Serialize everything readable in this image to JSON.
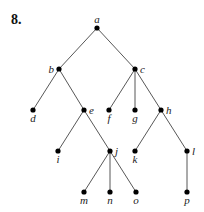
{
  "problem_number": "8.",
  "tree": {
    "nodes": [
      {
        "id": "a",
        "label": "a",
        "x": 97,
        "y": 28,
        "label_pos": "above"
      },
      {
        "id": "b",
        "label": "b",
        "x": 59,
        "y": 69,
        "label_pos": "left"
      },
      {
        "id": "c",
        "label": "c",
        "x": 135,
        "y": 69,
        "label_pos": "right"
      },
      {
        "id": "d",
        "label": "d",
        "x": 33,
        "y": 110,
        "label_pos": "below"
      },
      {
        "id": "e",
        "label": "e",
        "x": 84,
        "y": 110,
        "label_pos": "right"
      },
      {
        "id": "f",
        "label": "f",
        "x": 109,
        "y": 110,
        "label_pos": "below"
      },
      {
        "id": "g",
        "label": "g",
        "x": 135,
        "y": 110,
        "label_pos": "below"
      },
      {
        "id": "h",
        "label": "h",
        "x": 161,
        "y": 110,
        "label_pos": "right"
      },
      {
        "id": "i",
        "label": "i",
        "x": 58,
        "y": 151,
        "label_pos": "below"
      },
      {
        "id": "j",
        "label": "j",
        "x": 110,
        "y": 151,
        "label_pos": "right"
      },
      {
        "id": "k",
        "label": "k",
        "x": 135,
        "y": 151,
        "label_pos": "below"
      },
      {
        "id": "l",
        "label": "l",
        "x": 187,
        "y": 151,
        "label_pos": "right"
      },
      {
        "id": "m",
        "label": "m",
        "x": 84,
        "y": 192,
        "label_pos": "below"
      },
      {
        "id": "n",
        "label": "n",
        "x": 110,
        "y": 192,
        "label_pos": "below"
      },
      {
        "id": "o",
        "label": "o",
        "x": 136,
        "y": 192,
        "label_pos": "below"
      },
      {
        "id": "p",
        "label": "p",
        "x": 187,
        "y": 192,
        "label_pos": "below"
      }
    ],
    "edges": [
      [
        "a",
        "b"
      ],
      [
        "a",
        "c"
      ],
      [
        "b",
        "d"
      ],
      [
        "b",
        "e"
      ],
      [
        "c",
        "f"
      ],
      [
        "c",
        "g"
      ],
      [
        "c",
        "h"
      ],
      [
        "e",
        "i"
      ],
      [
        "e",
        "j"
      ],
      [
        "h",
        "k"
      ],
      [
        "h",
        "l"
      ],
      [
        "j",
        "m"
      ],
      [
        "j",
        "n"
      ],
      [
        "j",
        "o"
      ],
      [
        "l",
        "p"
      ]
    ]
  }
}
